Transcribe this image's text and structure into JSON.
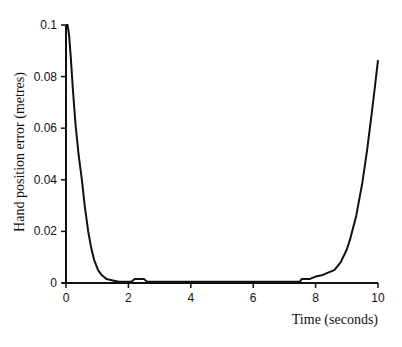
{
  "chart_data": {
    "type": "line",
    "title": "",
    "xlabel": "Time (seconds)",
    "ylabel": "Hand position error (metres)",
    "xlim": [
      0,
      10
    ],
    "ylim": [
      0,
      0.1
    ],
    "grid": false,
    "legend": null,
    "x_ticks": [
      0,
      2,
      4,
      6,
      8,
      10
    ],
    "x_tick_labels": [
      "0",
      "2",
      "4",
      "6",
      "8",
      "10"
    ],
    "y_ticks": [
      0,
      0.02,
      0.04,
      0.06,
      0.08,
      0.1
    ],
    "y_tick_labels": [
      "0",
      "0.02",
      "0.04",
      "0.06",
      "0.08",
      "0.1"
    ],
    "series": [
      {
        "name": "Hand position error",
        "color": "#111111",
        "x": [
          0.0,
          0.05,
          0.1,
          0.15,
          0.22,
          0.3,
          0.4,
          0.51,
          0.6,
          0.71,
          0.8,
          0.9,
          1.03,
          1.15,
          1.3,
          1.5,
          1.7,
          2.1,
          2.2,
          2.3,
          2.5,
          2.6,
          3.0,
          4.0,
          5.0,
          6.0,
          7.0,
          7.5,
          7.55,
          7.8,
          8.0,
          8.2,
          8.4,
          8.6,
          8.8,
          9.0,
          9.1,
          9.3,
          9.5,
          9.65,
          9.8,
          9.9,
          10.0
        ],
        "values": [
          0.1,
          0.1,
          0.096,
          0.088,
          0.075,
          0.062,
          0.05,
          0.04,
          0.03,
          0.02,
          0.014,
          0.009,
          0.005,
          0.003,
          0.0015,
          0.001,
          0.0005,
          0.0005,
          0.0015,
          0.0015,
          0.0015,
          0.0005,
          0.0005,
          0.0005,
          0.0005,
          0.0005,
          0.0005,
          0.0005,
          0.0015,
          0.0015,
          0.0025,
          0.003,
          0.004,
          0.005,
          0.008,
          0.013,
          0.0167,
          0.026,
          0.039,
          0.0515,
          0.066,
          0.076,
          0.0864
        ]
      }
    ]
  }
}
